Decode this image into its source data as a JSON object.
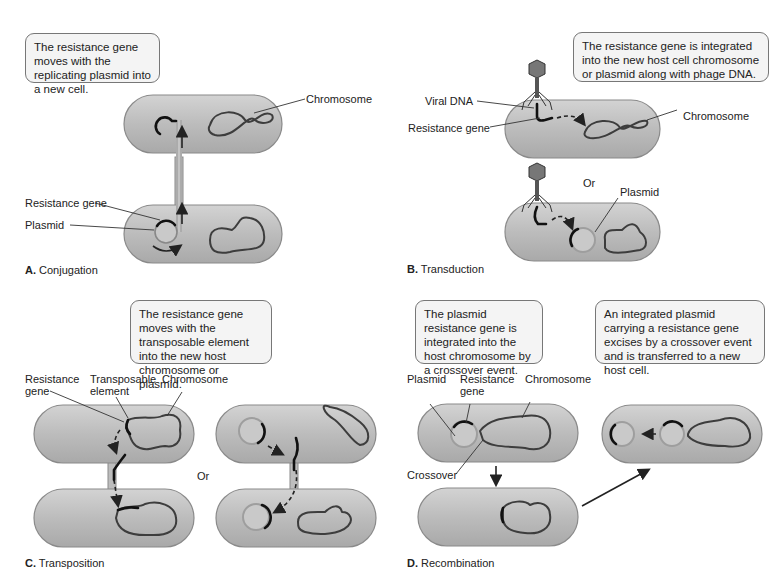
{
  "figure": {
    "panels": [
      {
        "id": "A",
        "letter": "A.",
        "title": "Conjugation",
        "callout": "The resistance gene moves with the replicating plasmid into a new cell.",
        "labels": {
          "chromosome": "Chromosome",
          "resistance_gene": "Resistance gene",
          "plasmid": "Plasmid"
        }
      },
      {
        "id": "B",
        "letter": "B.",
        "title": "Transduction",
        "callout": "The resistance gene is integrated into the new host cell chromosome or plasmid along with phage DNA.",
        "labels": {
          "viral_dna": "Viral DNA",
          "resistance_gene": "Resistance gene",
          "chromosome": "Chromosome",
          "or": "Or",
          "plasmid": "Plasmid"
        }
      },
      {
        "id": "C",
        "letter": "C.",
        "title": "Transposition",
        "callout": "The resistance gene moves with the transposable element into the new host chromosome or plasmid.",
        "labels": {
          "resistance_gene": "Resistance gene",
          "transposable_element": "Transposable element",
          "chromosome": "Chromosome",
          "or": "Or"
        }
      },
      {
        "id": "D",
        "letter": "D.",
        "title": "Recombination",
        "callout": "The plasmid resistance gene is integrated into the host chromosome by a crossover event.",
        "callout2": "An integrated plasmid carrying a resistance gene excises by a crossover event and is transferred to a new host cell.",
        "labels": {
          "plasmid": "Plasmid",
          "resistance_gene": "Resistance gene",
          "chromosome": "Chromosome",
          "crossover": "Crossover"
        }
      }
    ]
  }
}
